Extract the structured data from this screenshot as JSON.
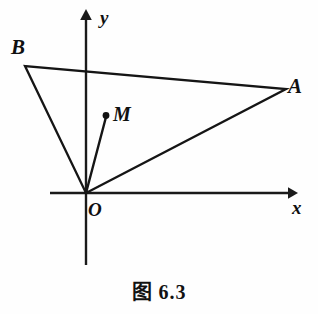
{
  "figure": {
    "caption": "图 6.3",
    "caption_prefix": "图",
    "caption_number": "6.3",
    "background_color": "#fefefe",
    "ink_color": "#151515"
  },
  "axes": {
    "x_label": "x",
    "y_label": "y",
    "origin_label": "O",
    "x_axis": {
      "x1": 50,
      "y1": 193,
      "x2": 295,
      "y2": 193
    },
    "y_axis": {
      "x1": 86,
      "y1": 265,
      "x2": 86,
      "y2": 12
    },
    "x_arrow_tip": {
      "x": 297,
      "y": 193
    },
    "y_arrow_tip": {
      "x": 86,
      "y": 9
    }
  },
  "points": [
    {
      "name": "O",
      "label": "O",
      "x": 86,
      "y": 193,
      "dot": false
    },
    {
      "name": "A",
      "label": "A",
      "x": 286,
      "y": 89,
      "dot": false
    },
    {
      "name": "B",
      "label": "B",
      "x": 25,
      "y": 66,
      "dot": false
    },
    {
      "name": "M",
      "label": "M",
      "x": 106,
      "y": 116,
      "dot": true
    }
  ],
  "segments": [
    {
      "name": "OA",
      "from": "O",
      "to": "A"
    },
    {
      "name": "OB",
      "from": "O",
      "to": "B"
    },
    {
      "name": "BA",
      "from": "B",
      "to": "A"
    },
    {
      "name": "OM",
      "from": "O",
      "to": "M"
    }
  ],
  "shape": {
    "type": "triangle",
    "vertices": [
      "O",
      "A",
      "B"
    ],
    "interior_point": "M"
  }
}
